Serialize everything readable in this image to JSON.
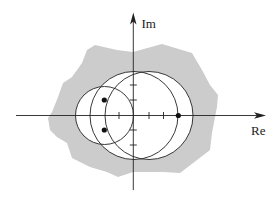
{
  "diagram": {
    "type": "complex-plane",
    "axes": {
      "x_label": "Re",
      "y_label": "Im",
      "origin": [
        133,
        115.5
      ],
      "x_range_px": [
        16,
        265
      ],
      "y_range_px": [
        13,
        190
      ],
      "x_ticks_px": [
        119,
        149,
        163.5
      ],
      "y_ticks_px": [
        85,
        100,
        130,
        145
      ]
    },
    "region": {
      "fill": "#cccccc",
      "points": "133,52 162,44 192,53 202,70 210,85 218,95 217,107 215,117 212,133 210,150 197,160 180,173 163,172 133,172 118,177 107,172 90,167 72,158 67,143 57,137 50,130 48,118 52,112 58,97 63,83 72,77 82,63 87,50 95,45 117,50"
    },
    "circles": [
      {
        "name": "small",
        "cx": 104.5,
        "cy": 115.5,
        "r": 29
      },
      {
        "name": "middle",
        "cx": 134,
        "cy": 115.5,
        "r": 44
      },
      {
        "name": "large",
        "cx": 149,
        "cy": 115.5,
        "r": 44
      }
    ],
    "points": [
      {
        "x": 104.3,
        "y": 100
      },
      {
        "x": 104.3,
        "y": 130
      },
      {
        "x": 178.3,
        "y": 115.5
      }
    ],
    "colors": {
      "stroke": "#222222",
      "circle_fill": "#ffffff",
      "region_fill": "#cccccc"
    }
  }
}
